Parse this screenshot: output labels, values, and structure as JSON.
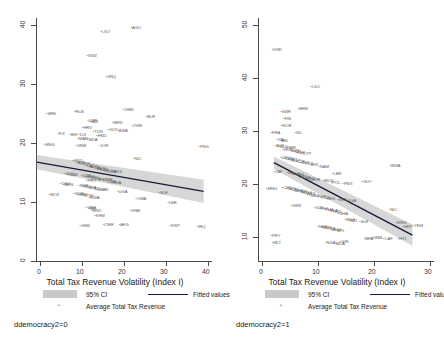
{
  "chart_data": [
    {
      "type": "scatter",
      "panel_caption": "ddemocracy2=0",
      "title": "",
      "xlabel": "Total Tax Revenue Volatility (Index I)",
      "ylabel": "",
      "xlim": [
        0,
        42
      ],
      "ylim": [
        -1,
        43
      ],
      "xticks": [
        0,
        10,
        20,
        30,
        40
      ],
      "yticks": [
        0,
        10,
        20,
        30,
        40
      ],
      "grid": false,
      "legend_position": "bottom",
      "legend": [
        {
          "key": "ci",
          "label": "95% CI",
          "marker": "band",
          "color": "#c9c9c9"
        },
        {
          "key": "fit",
          "label": "Fitted values",
          "marker": "line",
          "color": "#1a1a3a"
        },
        {
          "key": "points",
          "label": "Average Total Tax Revenue",
          "marker": "dot",
          "color": "#6a6a6a"
        }
      ],
      "fit_line": {
        "x0": 0.2,
        "y0": 16.9,
        "x1": 40.0,
        "y1": 11.6
      },
      "ci_band": {
        "half_width_left": 1.3,
        "half_width_right": 2.1
      },
      "points": [
        {
          "label": "LSO",
          "x": 15.6,
          "y": 40.2
        },
        {
          "label": "AGO",
          "x": 22.8,
          "y": 41.0
        },
        {
          "label": "SWZ",
          "x": 12.3,
          "y": 35.9
        },
        {
          "label": "GNQ",
          "x": 16.8,
          "y": 32.2
        },
        {
          "label": "SRB",
          "x": 2.6,
          "y": 25.5
        },
        {
          "label": "RUS",
          "x": 9.3,
          "y": 25.8
        },
        {
          "label": "OMN",
          "x": 20.9,
          "y": 26.1
        },
        {
          "label": "BLR",
          "x": 26.4,
          "y": 24.9
        },
        {
          "label": "UZB",
          "x": 12.5,
          "y": 24.1
        },
        {
          "label": "BDI",
          "x": 13.1,
          "y": 23.9
        },
        {
          "label": "BRN",
          "x": 18.4,
          "y": 23.8
        },
        {
          "label": "ZWE",
          "x": 23.1,
          "y": 23.3
        },
        {
          "label": "HRV",
          "x": 11.2,
          "y": 22.9
        },
        {
          "label": "GUY",
          "x": 17.3,
          "y": 22.5
        },
        {
          "label": "BWA",
          "x": 19.6,
          "y": 22.4
        },
        {
          "label": "TUN",
          "x": 13.8,
          "y": 22.1
        },
        {
          "label": "FJI",
          "x": 5.4,
          "y": 21.8
        },
        {
          "label": "BIH",
          "x": 8.2,
          "y": 21.7
        },
        {
          "label": "DJI",
          "x": 10.4,
          "y": 21.6
        },
        {
          "label": "HND",
          "x": 14.6,
          "y": 21.5
        },
        {
          "label": "MAR",
          "x": 10.1,
          "y": 20.9
        },
        {
          "label": "MDA",
          "x": 12.4,
          "y": 20.8
        },
        {
          "label": "MNG",
          "x": 2.1,
          "y": 19.8
        },
        {
          "label": "VNM",
          "x": 9.7,
          "y": 19.7
        },
        {
          "label": "JOR",
          "x": 15.2,
          "y": 19.6
        },
        {
          "label": "PNG",
          "x": 39.0,
          "y": 19.4
        },
        {
          "label": "NIC",
          "x": 23.4,
          "y": 17.3
        },
        {
          "label": "MKD",
          "x": 8.9,
          "y": 17.0
        },
        {
          "label": "AZE",
          "x": 9.8,
          "y": 16.6
        },
        {
          "label": "UKR",
          "x": 10.7,
          "y": 16.3
        },
        {
          "label": "KAZ",
          "x": 11.9,
          "y": 16.0
        },
        {
          "label": "ALB",
          "x": 12.8,
          "y": 15.9
        },
        {
          "label": "TJK",
          "x": 13.6,
          "y": 15.7
        },
        {
          "label": "ARM",
          "x": 14.4,
          "y": 15.5
        },
        {
          "label": "KGZ",
          "x": 15.1,
          "y": 15.3
        },
        {
          "label": "GEO",
          "x": 16.0,
          "y": 15.1
        },
        {
          "label": "LKA",
          "x": 17.2,
          "y": 15.0
        },
        {
          "label": "MYS",
          "x": 18.3,
          "y": 14.9
        },
        {
          "label": "SLV",
          "x": 6.9,
          "y": 14.6
        },
        {
          "label": "GAB",
          "x": 7.8,
          "y": 14.4
        },
        {
          "label": "DZA",
          "x": 11.0,
          "y": 14.2
        },
        {
          "label": "SEN",
          "x": 11.8,
          "y": 14.0
        },
        {
          "label": "IRN",
          "x": 13.0,
          "y": 13.9
        },
        {
          "label": "CIV",
          "x": 13.9,
          "y": 13.7
        },
        {
          "label": "EGY",
          "x": 14.8,
          "y": 13.5
        },
        {
          "label": "CMR",
          "x": 15.9,
          "y": 13.4
        },
        {
          "label": "ZMB",
          "x": 17.0,
          "y": 13.2
        },
        {
          "label": "GHA",
          "x": 18.1,
          "y": 13.0
        },
        {
          "label": "PRY",
          "x": 12.2,
          "y": 13.3
        },
        {
          "label": "TGO",
          "x": 5.9,
          "y": 12.8
        },
        {
          "label": "BEN",
          "x": 6.7,
          "y": 12.6
        },
        {
          "label": "NER",
          "x": 10.3,
          "y": 12.4
        },
        {
          "label": "MLI",
          "x": 11.4,
          "y": 12.2
        },
        {
          "label": "BFA",
          "x": 12.5,
          "y": 12.0
        },
        {
          "label": "TCD",
          "x": 13.4,
          "y": 11.9
        },
        {
          "label": "COG",
          "x": 14.3,
          "y": 11.7
        },
        {
          "label": "GIN",
          "x": 15.4,
          "y": 11.6
        },
        {
          "label": "UGA",
          "x": 19.6,
          "y": 11.4
        },
        {
          "label": "SDN",
          "x": 9.2,
          "y": 10.9
        },
        {
          "label": "MRT",
          "x": 10.2,
          "y": 10.7
        },
        {
          "label": "ETH",
          "x": 11.6,
          "y": 10.5
        },
        {
          "label": "RWA",
          "x": 12.8,
          "y": 10.3
        },
        {
          "label": "MOZ",
          "x": 3.3,
          "y": 10.8
        },
        {
          "label": "OMA",
          "x": 24.0,
          "y": 10.1
        },
        {
          "label": "LBR",
          "x": 31.6,
          "y": 9.3
        },
        {
          "label": "SLE",
          "x": 29.5,
          "y": 11.2
        },
        {
          "label": "YEM",
          "x": 12.0,
          "y": 8.4
        },
        {
          "label": "NPL",
          "x": 12.7,
          "y": 8.2
        },
        {
          "label": "BGD",
          "x": 13.4,
          "y": 7.9
        },
        {
          "label": "KHM",
          "x": 14.1,
          "y": 6.9
        },
        {
          "label": "VNM",
          "x": 22.6,
          "y": 7.8
        },
        {
          "label": "GNB",
          "x": 10.6,
          "y": 5.2
        },
        {
          "label": "CMR",
          "x": 16.2,
          "y": 5.3
        },
        {
          "label": "AFG",
          "x": 20.0,
          "y": 5.3
        },
        {
          "label": "KWT",
          "x": 32.1,
          "y": 5.1
        },
        {
          "label": "IRQ",
          "x": 38.6,
          "y": 5.0
        }
      ]
    },
    {
      "type": "scatter",
      "panel_caption": "ddemocracy2=1",
      "title": "",
      "xlabel": "Total Tax Revenue Volatility (Index I)",
      "ylabel": "",
      "xlim": [
        0,
        31
      ],
      "ylim": [
        7,
        53
      ],
      "xticks": [
        0,
        10,
        20,
        30
      ],
      "yticks": [
        10,
        20,
        30,
        40,
        50
      ],
      "grid": false,
      "legend_position": "bottom",
      "legend": [
        {
          "key": "ci",
          "label": "95% CI",
          "marker": "band",
          "color": "#c9c9c9"
        },
        {
          "key": "fit",
          "label": "Fitted values",
          "marker": "line",
          "color": "#1a1a3a"
        },
        {
          "key": "points",
          "label": "Average Total Tax Revenue",
          "marker": "dot",
          "color": "#6a6a6a"
        }
      ],
      "fit_line": {
        "x0": 2.8,
        "y0": 25.6,
        "x1": 27.2,
        "y1": 11.9
      },
      "ci_band": {
        "half_width_left": 1.2,
        "half_width_right": 2.0
      },
      "points": [
        {
          "label": "DNK",
          "x": 2.6,
          "y": 46.8
        },
        {
          "label": "LSO",
          "x": 9.4,
          "y": 39.8
        },
        {
          "label": "SWE",
          "x": 4.1,
          "y": 35.1
        },
        {
          "label": "BRB",
          "x": 7.2,
          "y": 35.6
        },
        {
          "label": "FIN",
          "x": 4.6,
          "y": 33.6
        },
        {
          "label": "NOR",
          "x": 4.2,
          "y": 32.3
        },
        {
          "label": "FRA",
          "x": 2.4,
          "y": 31.1
        },
        {
          "label": "ISL",
          "x": 6.6,
          "y": 31.0
        },
        {
          "label": "ITA",
          "x": 3.4,
          "y": 29.8
        },
        {
          "label": "BEL",
          "x": 4.0,
          "y": 29.5
        },
        {
          "label": "AUT",
          "x": 3.1,
          "y": 28.6
        },
        {
          "label": "NLD",
          "x": 3.8,
          "y": 28.4
        },
        {
          "label": "GBR",
          "x": 5.0,
          "y": 28.2
        },
        {
          "label": "HUN",
          "x": 4.5,
          "y": 27.8
        },
        {
          "label": "SVN",
          "x": 5.7,
          "y": 27.6
        },
        {
          "label": "NZL",
          "x": 6.3,
          "y": 27.4
        },
        {
          "label": "ISR",
          "x": 7.0,
          "y": 27.2
        },
        {
          "label": "CYP",
          "x": 7.8,
          "y": 27.0
        },
        {
          "label": "DEU",
          "x": 4.1,
          "y": 26.4
        },
        {
          "label": "LUX",
          "x": 4.8,
          "y": 26.2
        },
        {
          "label": "PRT",
          "x": 5.4,
          "y": 26.0
        },
        {
          "label": "ESP",
          "x": 6.0,
          "y": 25.8
        },
        {
          "label": "CZE",
          "x": 6.8,
          "y": 25.6
        },
        {
          "label": "EST",
          "x": 7.6,
          "y": 25.4
        },
        {
          "label": "POL",
          "x": 8.4,
          "y": 25.2
        },
        {
          "label": "SVK",
          "x": 9.1,
          "y": 25.0
        },
        {
          "label": "NAM",
          "x": 10.8,
          "y": 24.6
        },
        {
          "label": "BWA",
          "x": 23.4,
          "y": 24.8
        },
        {
          "label": "ZAF",
          "x": 2.9,
          "y": 23.6
        },
        {
          "label": "IRL",
          "x": 5.2,
          "y": 23.4
        },
        {
          "label": "AUS",
          "x": 5.9,
          "y": 23.2
        },
        {
          "label": "CAN",
          "x": 6.5,
          "y": 23.0
        },
        {
          "label": "JPN",
          "x": 7.2,
          "y": 22.8
        },
        {
          "label": "LVA",
          "x": 7.9,
          "y": 22.6
        },
        {
          "label": "LTU",
          "x": 8.6,
          "y": 22.4
        },
        {
          "label": "BGR",
          "x": 9.3,
          "y": 22.2
        },
        {
          "label": "LBR",
          "x": 13.2,
          "y": 23.2
        },
        {
          "label": "MUS",
          "x": 11.6,
          "y": 22.0
        },
        {
          "label": "POL",
          "x": 13.0,
          "y": 21.6
        },
        {
          "label": "PNG",
          "x": 15.0,
          "y": 21.4
        },
        {
          "label": "GUY",
          "x": 18.4,
          "y": 21.8
        },
        {
          "label": "MNG",
          "x": 1.6,
          "y": 20.4
        },
        {
          "label": "CHL",
          "x": 4.4,
          "y": 20.6
        },
        {
          "label": "URY",
          "x": 5.1,
          "y": 20.4
        },
        {
          "label": "CRI",
          "x": 5.8,
          "y": 20.2
        },
        {
          "label": "BRA",
          "x": 6.4,
          "y": 20.0
        },
        {
          "label": "TUR",
          "x": 7.1,
          "y": 19.8
        },
        {
          "label": "ROU",
          "x": 7.8,
          "y": 19.6
        },
        {
          "label": "ARG",
          "x": 8.5,
          "y": 19.4
        },
        {
          "label": "MEX",
          "x": 9.2,
          "y": 19.2
        },
        {
          "label": "PER",
          "x": 10.4,
          "y": 19.0
        },
        {
          "label": "COL",
          "x": 11.2,
          "y": 18.8
        },
        {
          "label": "VEN",
          "x": 12.0,
          "y": 18.6
        },
        {
          "label": "BOL",
          "x": 14.2,
          "y": 18.4
        },
        {
          "label": "UGA",
          "x": 15.6,
          "y": 18.2
        },
        {
          "label": "KEN",
          "x": 6.0,
          "y": 17.2
        },
        {
          "label": "IDN",
          "x": 10.1,
          "y": 16.8
        },
        {
          "label": "PHL",
          "x": 11.0,
          "y": 16.6
        },
        {
          "label": "THA",
          "x": 11.8,
          "y": 16.4
        },
        {
          "label": "LKA",
          "x": 12.6,
          "y": 16.2
        },
        {
          "label": "IND",
          "x": 13.4,
          "y": 16.0
        },
        {
          "label": "GHA",
          "x": 14.2,
          "y": 15.8
        },
        {
          "label": "NIC",
          "x": 23.2,
          "y": 16.4
        },
        {
          "label": "MDG",
          "x": 15.4,
          "y": 14.6
        },
        {
          "label": "MLI",
          "x": 16.2,
          "y": 14.4
        },
        {
          "label": "SLE",
          "x": 18.0,
          "y": 14.2
        },
        {
          "label": "MNG",
          "x": 24.4,
          "y": 14.0
        },
        {
          "label": "NER",
          "x": 10.6,
          "y": 13.2
        },
        {
          "label": "BEN",
          "x": 11.4,
          "y": 13.0
        },
        {
          "label": "TZA",
          "x": 12.2,
          "y": 12.8
        },
        {
          "label": "BGD",
          "x": 13.0,
          "y": 12.6
        },
        {
          "label": "NPL",
          "x": 13.8,
          "y": 12.4
        },
        {
          "label": "SEP",
          "x": 25.6,
          "y": 13.2
        },
        {
          "label": "YEM",
          "x": 27.4,
          "y": 13.4
        },
        {
          "label": "PRY",
          "x": 2.4,
          "y": 11.6
        },
        {
          "label": "MLT",
          "x": 2.6,
          "y": 10.2
        },
        {
          "label": "NGA",
          "x": 12.0,
          "y": 10.3
        },
        {
          "label": "MDA",
          "x": 13.6,
          "y": 10.1
        },
        {
          "label": "GIN",
          "x": 14.6,
          "y": 10.4
        },
        {
          "label": "BFA",
          "x": 18.8,
          "y": 11.0
        },
        {
          "label": "GMB",
          "x": 20.1,
          "y": 11.2
        },
        {
          "label": "CAF",
          "x": 22.2,
          "y": 11.0
        },
        {
          "label": "HTI",
          "x": 24.8,
          "y": 11.0
        }
      ]
    }
  ]
}
